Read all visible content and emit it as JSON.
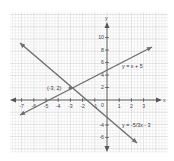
{
  "chart_data": {
    "type": "line",
    "title": "",
    "xlabel": "x",
    "ylabel": "y",
    "x_ticks": [
      -7,
      -6,
      -5,
      -4,
      -3,
      -2,
      -1,
      1,
      2,
      3
    ],
    "y_ticks": [
      10,
      8,
      6,
      4,
      2,
      -4,
      -6
    ],
    "origin_label": "0",
    "grid": true,
    "legend": "none",
    "series": [
      {
        "name": "y = x + 5",
        "equation": "y = x + 5",
        "slope": 1,
        "intercept": 5,
        "drawn_endpoints_px": [
          [
            20,
            115
          ],
          [
            152,
            47
          ]
        ]
      },
      {
        "name": "y = -5/3x - 3",
        "equation": "y = -5/3x - 3",
        "slope": -1.6667,
        "intercept": -3,
        "drawn_endpoints_px": [
          [
            20,
            43
          ],
          [
            137,
            143
          ]
        ]
      }
    ],
    "annotations": [
      {
        "text": "(-3, 2)",
        "point": [
          -3,
          2
        ],
        "note": "intersection"
      }
    ],
    "axis_scale_note": "Endpoints are placed at observed pixel positions rather than computed from the equations: the y-axis labels imply ~6.25 px/unit vertically versus ~12.2 px/unit horizontally, which conflicts with the near-square grid."
  },
  "labels": {
    "x_axis": "x",
    "y_axis": "y",
    "origin": "0",
    "line1": "y = x + 5",
    "line2": "y = -5/3x - 3",
    "intersection": "(-3, 2)"
  }
}
